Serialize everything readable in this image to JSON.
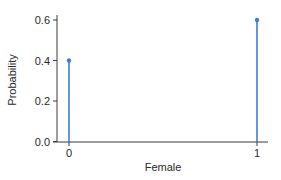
{
  "chart_data": {
    "type": "stem",
    "title": "",
    "xlabel": "Female",
    "ylabel": "Probability",
    "x": [
      0,
      1
    ],
    "values": [
      0.4,
      0.6
    ],
    "x_ticks": [
      "0",
      "1"
    ],
    "y_ticks": [
      "0.0",
      "0.2",
      "0.4",
      "0.6"
    ],
    "xlim": [
      -0.06,
      1.06
    ],
    "ylim": [
      0,
      0.62
    ],
    "grid": false,
    "legend": null,
    "color": "#3b7dd8"
  },
  "axes": {
    "xlabel": "Female",
    "ylabel": "Probability"
  }
}
